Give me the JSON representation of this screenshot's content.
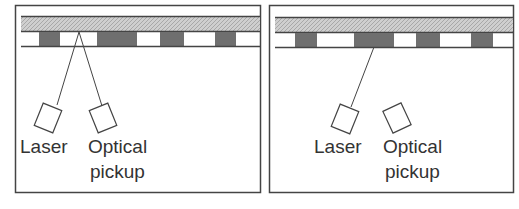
{
  "colors": {
    "frame": "#444444",
    "substrate": "#c4c4c4",
    "pit": "#6f6f6f",
    "line": "#555555",
    "text": "#333333"
  },
  "panels": [
    {
      "id": "left",
      "labels": {
        "laser": "Laser",
        "pickup_line1": "Optical",
        "pickup_line2": "pickup"
      },
      "beam": "reflected-to-pickup"
    },
    {
      "id": "right",
      "labels": {
        "laser": "Laser",
        "pickup_line1": "Optical",
        "pickup_line2": "pickup"
      },
      "beam": "scattered-no-return"
    }
  ]
}
